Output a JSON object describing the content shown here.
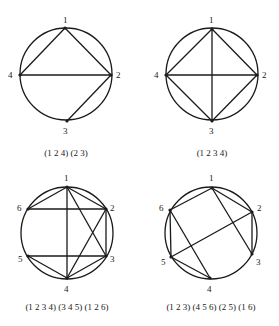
{
  "figures": [
    {
      "caption": "(1 2 4) (2 3)",
      "circle": {
        "cx": 66,
        "cy": 74,
        "r": 46
      },
      "nodes": [
        {
          "id": "1",
          "x": 65,
          "y": 28,
          "lx": 63,
          "ly": 23
        },
        {
          "id": "2",
          "x": 111,
          "y": 75,
          "lx": 116,
          "ly": 78
        },
        {
          "id": "3",
          "x": 67,
          "y": 121,
          "lx": 63,
          "ly": 134
        },
        {
          "id": "4",
          "x": 20,
          "y": 75,
          "lx": 8,
          "ly": 78
        }
      ],
      "edges": [
        [
          "1",
          "2"
        ],
        [
          "1",
          "4"
        ],
        [
          "4",
          "2"
        ],
        [
          "2",
          "3"
        ]
      ],
      "caption_pos": {
        "x": 66,
        "y": 156
      }
    },
    {
      "caption": "(1 2 3 4)",
      "circle": {
        "cx": 212,
        "cy": 74,
        "r": 46
      },
      "nodes": [
        {
          "id": "1",
          "x": 212,
          "y": 29,
          "lx": 209,
          "ly": 23
        },
        {
          "id": "2",
          "x": 257,
          "y": 75,
          "lx": 262,
          "ly": 78
        },
        {
          "id": "3",
          "x": 212,
          "y": 121,
          "lx": 209,
          "ly": 134
        },
        {
          "id": "4",
          "x": 166,
          "y": 75,
          "lx": 154,
          "ly": 78
        }
      ],
      "edges": [
        [
          "1",
          "2"
        ],
        [
          "2",
          "3"
        ],
        [
          "3",
          "4"
        ],
        [
          "4",
          "1"
        ],
        [
          "1",
          "3"
        ],
        [
          "4",
          "2"
        ]
      ],
      "caption_pos": {
        "x": 212,
        "y": 156
      }
    },
    {
      "caption": "(1 2 3 4) (3 4 5) (1 2 6)",
      "circle": {
        "cx": 67,
        "cy": 233,
        "r": 46
      },
      "nodes": [
        {
          "id": "1",
          "x": 67,
          "y": 187,
          "lx": 64,
          "ly": 181
        },
        {
          "id": "2",
          "x": 106,
          "y": 209,
          "lx": 110,
          "ly": 211
        },
        {
          "id": "3",
          "x": 106,
          "y": 256,
          "lx": 110,
          "ly": 262
        },
        {
          "id": "4",
          "x": 67,
          "y": 278,
          "lx": 64,
          "ly": 292
        },
        {
          "id": "5",
          "x": 28,
          "y": 256,
          "lx": 18,
          "ly": 262
        },
        {
          "id": "6",
          "x": 28,
          "y": 209,
          "lx": 17,
          "ly": 211
        }
      ],
      "edges": [
        [
          "1",
          "2"
        ],
        [
          "2",
          "3"
        ],
        [
          "3",
          "4"
        ],
        [
          "4",
          "1"
        ],
        [
          "3",
          "5"
        ],
        [
          "4",
          "5"
        ],
        [
          "1",
          "3"
        ],
        [
          "2",
          "4"
        ],
        [
          "1",
          "6"
        ],
        [
          "2",
          "6"
        ]
      ],
      "caption_pos": {
        "x": 67,
        "y": 310
      }
    },
    {
      "caption": "(1 2 3) (4 5 6) (2 5) (1 6)",
      "circle": {
        "cx": 211,
        "cy": 233,
        "r": 46
      },
      "nodes": [
        {
          "id": "1",
          "x": 212,
          "y": 188,
          "lx": 209,
          "ly": 181
        },
        {
          "id": "2",
          "x": 252,
          "y": 212,
          "lx": 257,
          "ly": 211
        },
        {
          "id": "3",
          "x": 252,
          "y": 254,
          "lx": 256,
          "ly": 265
        },
        {
          "id": "4",
          "x": 210,
          "y": 278,
          "lx": 207,
          "ly": 292
        },
        {
          "id": "5",
          "x": 171,
          "y": 257,
          "lx": 161,
          "ly": 265
        },
        {
          "id": "6",
          "x": 170,
          "y": 210,
          "lx": 159,
          "ly": 211
        }
      ],
      "edges": [
        [
          "1",
          "2"
        ],
        [
          "2",
          "3"
        ],
        [
          "1",
          "3"
        ],
        [
          "4",
          "5"
        ],
        [
          "5",
          "6"
        ],
        [
          "4",
          "6"
        ],
        [
          "2",
          "5"
        ],
        [
          "1",
          "6"
        ]
      ],
      "caption_pos": {
        "x": 211,
        "y": 310
      }
    }
  ]
}
